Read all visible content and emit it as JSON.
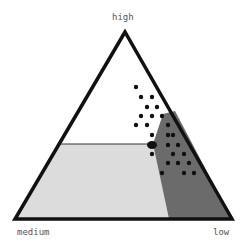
{
  "labels": {
    "top": "high",
    "left": "medium",
    "right": "low"
  },
  "colors": {
    "outline": "#111111",
    "light_region": "#dcdcdc",
    "dark_region": "#6b6b6b",
    "dot": "#111111",
    "background": "#ffffff"
  },
  "triangle": {
    "apex": [
      125,
      32
    ],
    "left": [
      15,
      219
    ],
    "right": [
      232,
      219
    ]
  },
  "regions": [
    {
      "name": "light",
      "points": "61,144 153,144 169,219 15,219"
    },
    {
      "name": "dark",
      "points": "163,114 175,111 232,219 169,219 153,144"
    }
  ],
  "dots": [
    [
      136,
      87
    ],
    [
      141,
      97
    ],
    [
      152,
      97
    ],
    [
      147,
      107
    ],
    [
      157,
      107
    ],
    [
      141,
      116
    ],
    [
      152,
      116
    ],
    [
      162,
      116
    ],
    [
      136,
      125
    ],
    [
      147,
      125
    ],
    [
      168,
      125
    ],
    [
      152,
      135
    ],
    [
      168,
      135
    ],
    [
      173,
      135
    ],
    [
      168,
      145
    ],
    [
      178,
      145
    ],
    [
      152,
      154
    ],
    [
      173,
      154
    ],
    [
      184,
      154
    ],
    [
      168,
      163
    ],
    [
      178,
      163
    ],
    [
      189,
      163
    ],
    [
      162,
      173
    ],
    [
      184,
      173
    ],
    [
      194,
      173
    ]
  ],
  "marker": {
    "center": [
      152,
      145
    ],
    "r": 4
  }
}
